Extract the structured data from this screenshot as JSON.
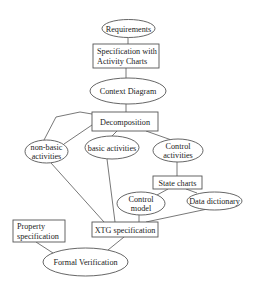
{
  "diagram": {
    "background": "#ffffff",
    "stroke_color": "#555555",
    "text_color": "#222222",
    "nodes": [
      {
        "id": "requirements",
        "shape": "ellipse",
        "cx": 128.5,
        "cy": 28.5,
        "rx": 26.5,
        "ry": 9,
        "lines": [
          "Requirements"
        ]
      },
      {
        "id": "spec-activity-charts",
        "shape": "rect",
        "x": 93,
        "y": 44,
        "w": 66,
        "h": 24,
        "lines": [
          "Specification with",
          "Activity Charts"
        ],
        "align": "left"
      },
      {
        "id": "context-diagram",
        "shape": "ellipse",
        "cx": 128,
        "cy": 91,
        "rx": 38,
        "ry": 13,
        "lines": [
          "Context Diagram"
        ]
      },
      {
        "id": "decomposition",
        "shape": "rect",
        "x": 92,
        "y": 112,
        "w": 66,
        "h": 19,
        "lines": [
          "Decomposition"
        ]
      },
      {
        "id": "non-basic-activities",
        "shape": "ellipse",
        "cx": 46.5,
        "cy": 151.5,
        "rx": 21.5,
        "ry": 11.5,
        "lines": [
          "non-basic",
          "activities"
        ]
      },
      {
        "id": "basic-activities",
        "shape": "ellipse",
        "cx": 112,
        "cy": 147.5,
        "rx": 27,
        "ry": 11.5,
        "lines": [
          "basic activities"
        ]
      },
      {
        "id": "control-activities",
        "shape": "ellipse",
        "cx": 178,
        "cy": 150.5,
        "rx": 25,
        "ry": 11.5,
        "lines": [
          "Control",
          "activities"
        ]
      },
      {
        "id": "state-charts",
        "shape": "rect",
        "x": 153,
        "y": 176,
        "w": 49,
        "h": 13,
        "lines": [
          "State charts"
        ]
      },
      {
        "id": "control-model",
        "shape": "ellipse",
        "cx": 141,
        "cy": 203.5,
        "rx": 24,
        "ry": 11.5,
        "lines": [
          "Control",
          "model"
        ]
      },
      {
        "id": "data-dictionary",
        "shape": "ellipse",
        "cx": 214.5,
        "cy": 201,
        "rx": 27.5,
        "ry": 9,
        "lines": [
          "Data dictionary"
        ]
      },
      {
        "id": "xtg-specification",
        "shape": "rect",
        "x": 92,
        "y": 222,
        "w": 66,
        "h": 15,
        "lines": [
          "XTG specification"
        ]
      },
      {
        "id": "property-specification",
        "shape": "rect",
        "x": 13,
        "y": 220,
        "w": 52,
        "h": 22,
        "lines": [
          "Property",
          "specification"
        ],
        "align": "left"
      },
      {
        "id": "formal-verification",
        "shape": "ellipse",
        "cx": 85.5,
        "cy": 262,
        "rx": 42.5,
        "ry": 14,
        "lines": [
          "Formal Verification"
        ]
      }
    ],
    "edges": [
      {
        "from": "requirements",
        "to": "spec-activity-charts",
        "points": [
          [
            128,
            37.5
          ],
          [
            128,
            44
          ]
        ]
      },
      {
        "from": "spec-activity-charts",
        "to": "context-diagram",
        "points": [
          [
            126,
            68
          ],
          [
            126,
            78
          ]
        ]
      },
      {
        "from": "context-diagram",
        "to": "decomposition",
        "points": [
          [
            126,
            104
          ],
          [
            126,
            112
          ]
        ]
      },
      {
        "from": "decomposition",
        "to": "non-basic-activities",
        "points": [
          [
            92,
            114
          ],
          [
            80,
            112
          ],
          [
            56,
            117
          ],
          [
            44,
            140
          ]
        ]
      },
      {
        "from": "decomposition",
        "to": "non-basic-activities",
        "points": [
          [
            92,
            125
          ],
          [
            64,
            144
          ]
        ]
      },
      {
        "from": "decomposition",
        "to": "basic-activities",
        "points": [
          [
            117,
            131
          ],
          [
            112,
            136
          ]
        ]
      },
      {
        "from": "decomposition",
        "to": "control-activities",
        "points": [
          [
            146,
            131
          ],
          [
            170,
            139.5
          ]
        ]
      },
      {
        "from": "control-activities",
        "to": "state-charts",
        "points": [
          [
            177,
            162
          ],
          [
            177,
            176
          ]
        ]
      },
      {
        "from": "state-charts",
        "to": "control-model",
        "points": [
          [
            168,
            189
          ],
          [
            157,
            195
          ]
        ]
      },
      {
        "from": "state-charts",
        "to": "data-dictionary",
        "points": [
          [
            186,
            189
          ],
          [
            197,
            193
          ]
        ]
      },
      {
        "from": "non-basic-activities",
        "to": "xtg-specification",
        "points": [
          [
            51,
            163
          ],
          [
            104,
            222
          ]
        ]
      },
      {
        "from": "basic-activities",
        "to": "xtg-specification",
        "points": [
          [
            107,
            159
          ],
          [
            115,
            222
          ]
        ]
      },
      {
        "from": "control-model",
        "to": "xtg-specification",
        "points": [
          [
            139,
            215
          ],
          [
            139,
            222
          ]
        ]
      },
      {
        "from": "data-dictionary",
        "to": "xtg-specification",
        "points": [
          [
            205,
            209.5
          ],
          [
            146,
            222
          ]
        ]
      },
      {
        "from": "xtg-specification",
        "to": "formal-verification",
        "points": [
          [
            124,
            237
          ],
          [
            108,
            250
          ]
        ]
      },
      {
        "from": "property-specification",
        "to": "formal-verification",
        "points": [
          [
            36,
            242
          ],
          [
            53,
            253
          ]
        ]
      }
    ]
  }
}
